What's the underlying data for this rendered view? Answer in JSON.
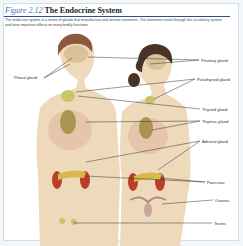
{
  "figure": {
    "number": "Figure 2.12",
    "title": "The Endocrine System",
    "description": "The endocrine system is a series of glands that manufacture and secrete hormones. The hormones travel through the circulatory system and have important effects on many bodily functions."
  },
  "labels": {
    "pineal": "Pineal gland",
    "pituitary": "Pituitary gland",
    "parathyroid": "Parathyroid gland",
    "thyroid": "Thyroid gland",
    "thymus": "Thymus gland",
    "adrenal": "Adrenal gland",
    "pancreas": "Pancreas",
    "ovaries": "Ovaries",
    "testes": "Testes"
  },
  "colors": {
    "figure_number": "#3a7bbf",
    "rule": "#2f4f8f",
    "skin": "#efd9bb",
    "gland": "#c9c46a",
    "kidney": "#b8402a"
  }
}
